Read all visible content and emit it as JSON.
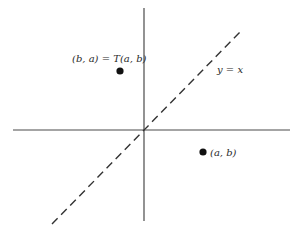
{
  "diagram": {
    "axes": {
      "x_axis": {
        "x1": 13,
        "y1": 130,
        "x2": 290,
        "y2": 130,
        "color": "#4a4a4a"
      },
      "y_axis": {
        "x1": 144,
        "y1": 8,
        "x2": 144,
        "y2": 221,
        "color": "#4a4a4a"
      }
    },
    "line_y_equals_x": {
      "label": "y = x",
      "x1": 52,
      "y1": 224,
      "x2": 241,
      "y2": 31,
      "style": "dashed",
      "color": "#333333"
    },
    "points": [
      {
        "id": "image",
        "label": "(b, a) = T(a, b)",
        "cx": 120,
        "cy": 71,
        "r": 3.6
      },
      {
        "id": "original",
        "label": "(a, b)",
        "cx": 203,
        "cy": 152,
        "r": 3.6
      }
    ],
    "labels": {
      "image_point": "(b, a) = T(a, b)",
      "original_point": "(a, b)",
      "line": "y = x"
    },
    "colors": {
      "background": "#ffffff",
      "ink": "#1a1a1a",
      "axis": "#4a4a4a"
    }
  }
}
